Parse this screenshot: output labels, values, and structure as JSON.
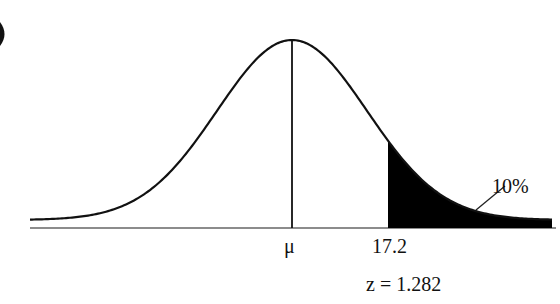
{
  "chart_data": {
    "type": "area",
    "title": "",
    "mean_label": "μ",
    "cutoff_value": "17.2",
    "z_label": "z = 1.282",
    "tail_area_label": "10%",
    "tail": "right",
    "z": 1.282,
    "tail_probability": 0.1,
    "grid": false,
    "legend": "none"
  },
  "labels": {
    "mu": "μ",
    "cutoff": "17.2",
    "z": "z = 1.282",
    "tail_pct": "10%"
  },
  "colors": {
    "curve": "#111111",
    "shade": "#000000",
    "axis": "#555555",
    "background": "#ffffff"
  }
}
